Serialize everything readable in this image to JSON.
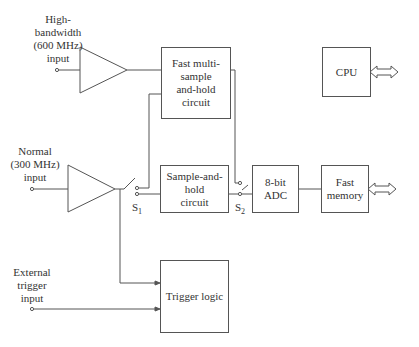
{
  "diagram": {
    "inputs": {
      "high_bandwidth": [
        "High-",
        "bandwidth",
        "(600 MHz)",
        "input"
      ],
      "normal": [
        "Normal",
        "(300 MHz)",
        "input"
      ],
      "external_trigger": [
        "External",
        "trigger",
        "input"
      ]
    },
    "blocks": {
      "fast_multi_sample": [
        "Fast multi-",
        "sample",
        "and-hold circuit"
      ],
      "sample_and_hold": [
        "Sample-and-",
        "hold",
        "circuit"
      ],
      "adc": "8-bit ADC",
      "fast_memory": [
        "Fast",
        "memory"
      ],
      "cpu": "CPU",
      "trigger_logic": "Trigger logic"
    },
    "switches": {
      "s1": {
        "letter": "S",
        "sub": "1"
      },
      "s2": {
        "letter": "S",
        "sub": "2"
      }
    },
    "colors": {
      "line": "#555555",
      "text": "#333333",
      "background": "#ffffff"
    }
  }
}
